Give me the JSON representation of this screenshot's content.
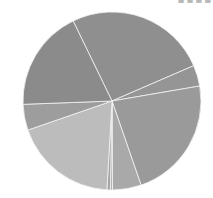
{
  "chart_data": {
    "type": "pie",
    "title": "",
    "center": [
      112,
      101
    ],
    "radius": 89,
    "start_angle_deg": 334.1,
    "stroke_color": "#f2f2f2",
    "slices": [
      {
        "label": "",
        "value": 25.7,
        "color": "#8f8f8f"
      },
      {
        "label": "",
        "value": 3.8,
        "color": "#959595"
      },
      {
        "label": "",
        "value": 22.4,
        "color": "#9a9a9a"
      },
      {
        "label": "",
        "value": 5.2,
        "color": "#a9a9a9"
      },
      {
        "label": "",
        "value": 0.4,
        "color": "#b3b3b3"
      },
      {
        "label": "",
        "value": 0.6,
        "color": "#a2a2a2"
      },
      {
        "label": "",
        "value": 18.8,
        "color": "#bcbcbc"
      },
      {
        "label": "",
        "value": 4.7,
        "color": "#9d9d9d"
      },
      {
        "label": "",
        "value": 18.4,
        "color": "#8b8b8b"
      }
    ],
    "legend": null
  },
  "overlay": {
    "top_right_text": "· · · ■ ■ ■ ■"
  }
}
